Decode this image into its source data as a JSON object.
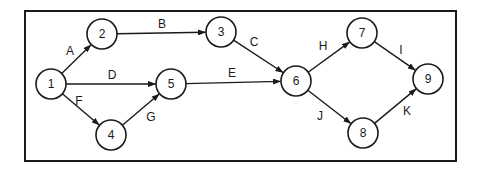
{
  "diagram": {
    "type": "activity-on-arrow network",
    "frame": {
      "x": 25,
      "y": 11,
      "width": 431,
      "height": 150
    },
    "node_radius": 15,
    "colors": {
      "stroke": "#1a1a1a",
      "fill": "#ffffff"
    },
    "nodes": [
      {
        "id": "1",
        "label": "1",
        "x": 51,
        "y": 84
      },
      {
        "id": "2",
        "label": "2",
        "x": 102,
        "y": 34
      },
      {
        "id": "3",
        "label": "3",
        "x": 221,
        "y": 32
      },
      {
        "id": "4",
        "label": "4",
        "x": 111,
        "y": 135
      },
      {
        "id": "5",
        "label": "5",
        "x": 171,
        "y": 84
      },
      {
        "id": "6",
        "label": "6",
        "x": 296,
        "y": 81
      },
      {
        "id": "7",
        "label": "7",
        "x": 362,
        "y": 33
      },
      {
        "id": "8",
        "label": "8",
        "x": 363,
        "y": 133
      },
      {
        "id": "9",
        "label": "9",
        "x": 428,
        "y": 79
      }
    ],
    "edges": [
      {
        "id": "A",
        "label": "A",
        "from": "1",
        "to": "2",
        "lx": 70,
        "ly": 51
      },
      {
        "id": "B",
        "label": "B",
        "from": "2",
        "to": "3",
        "lx": 162,
        "ly": 24
      },
      {
        "id": "C",
        "label": "C",
        "from": "3",
        "to": "6",
        "lx": 254,
        "ly": 42
      },
      {
        "id": "D",
        "label": "D",
        "from": "1",
        "to": "5",
        "lx": 112,
        "ly": 75
      },
      {
        "id": "E",
        "label": "E",
        "from": "5",
        "to": "6",
        "lx": 232,
        "ly": 73
      },
      {
        "id": "F",
        "label": "F",
        "from": "1",
        "to": "4",
        "lx": 79,
        "ly": 101
      },
      {
        "id": "G",
        "label": "G",
        "from": "4",
        "to": "5",
        "lx": 151,
        "ly": 117
      },
      {
        "id": "H",
        "label": "H",
        "from": "6",
        "to": "7",
        "lx": 323,
        "ly": 46
      },
      {
        "id": "I",
        "label": "I",
        "from": "7",
        "to": "9",
        "lx": 401,
        "ly": 50
      },
      {
        "id": "J",
        "label": "J",
        "from": "6",
        "to": "8",
        "lx": 320,
        "ly": 116
      },
      {
        "id": "K",
        "label": "K",
        "from": "8",
        "to": "9",
        "lx": 407,
        "ly": 111
      }
    ]
  }
}
